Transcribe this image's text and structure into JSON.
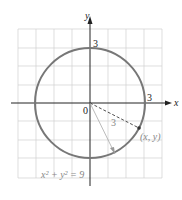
{
  "diagram": {
    "axes": {
      "x_label": "x",
      "y_label": "y",
      "origin_label": "0"
    },
    "ticks": {
      "x_tick": "3",
      "y_tick": "3"
    },
    "radius_label": "3",
    "point_label": "(x, y)",
    "equation": "x² + y² = 9",
    "colors": {
      "circle": "#777777",
      "grid": "#cccccc",
      "axis": "#222222"
    }
  }
}
